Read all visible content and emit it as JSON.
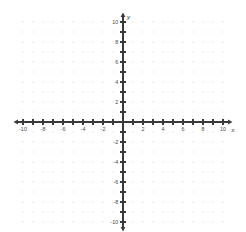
{
  "chart_data": {
    "type": "scatter",
    "title": "",
    "subtitle": "",
    "xlabel": "x",
    "ylabel": "y",
    "xlim": [
      -10,
      10
    ],
    "ylim": [
      -10,
      10
    ],
    "grid": true,
    "grid_style": "dots",
    "grid_step": 1,
    "tick_step": 1,
    "label_step": 2,
    "legend": false,
    "legend_position": "none",
    "series": [],
    "annotations": [],
    "x_tick_labels": [
      "-10",
      "-8",
      "-6",
      "-4",
      "-2",
      "2",
      "4",
      "6",
      "8",
      "10"
    ],
    "x_tick_values": [
      -10,
      -8,
      -6,
      -4,
      -2,
      2,
      4,
      6,
      8,
      10
    ],
    "y_tick_labels": [
      "10",
      "8",
      "6",
      "4",
      "2",
      "-2",
      "-4",
      "-6",
      "-8",
      "-10"
    ],
    "y_tick_values": [
      10,
      8,
      6,
      4,
      2,
      -2,
      -4,
      -6,
      -8,
      -10
    ],
    "origin_label": "",
    "axis_arrows": [
      "left",
      "right",
      "up",
      "down"
    ]
  },
  "axes": {
    "x_name": "x",
    "y_name": "y"
  },
  "colors": {
    "background": "#ffffff",
    "axis": "#3a3a3a",
    "grid_dot": "#d9d9d9",
    "tick_label": "#4a4a4a",
    "axis_name": "#2b2b2b"
  },
  "geometry": {
    "width": 246,
    "height": 232,
    "origin_x": 123,
    "origin_y": 122,
    "unit_px": 10,
    "tick_half_len": 2.6
  }
}
